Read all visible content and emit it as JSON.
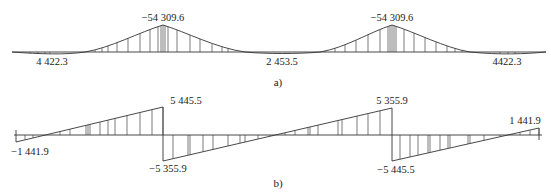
{
  "diagram_a": {
    "caption": "a)",
    "title": "Bending moment diagram",
    "labels": {
      "peak_left": "−54 309.6",
      "peak_right": "−54 309.6",
      "end_left": "4 422.3",
      "mid": "2 453.5",
      "end_right": "4422.3"
    }
  },
  "diagram_b": {
    "caption": "b)",
    "title": "Shear force diagram",
    "labels": {
      "top_left_jump": "5 445.5",
      "bottom_left_jump": "−5 355.9",
      "top_right_jump": "5 355.9",
      "bottom_right_jump": "−5 445.5",
      "start_left": "−1 441.9",
      "end_right": "1 441.9"
    }
  },
  "chart_data": [
    {
      "type": "line",
      "title": "a) Moment diagram",
      "x": [
        "left end",
        "left peak (support)",
        "middle",
        "right peak (support)",
        "right end"
      ],
      "values": [
        4422.3,
        -54309.6,
        2453.5,
        -54309.6,
        4422.3
      ]
    },
    {
      "type": "line",
      "title": "b) Shear diagram",
      "x": [
        "left end",
        "left support (left side)",
        "left support (right side)",
        "right support (left side)",
        "right support (right side)",
        "right end"
      ],
      "values": [
        -1441.9,
        5445.5,
        -5355.9,
        5355.9,
        -5445.5,
        1441.9
      ]
    }
  ]
}
